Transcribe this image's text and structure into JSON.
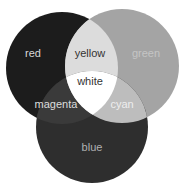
{
  "diagram": {
    "type": "venn",
    "title": "",
    "circles": [
      {
        "id": "red",
        "label": "red",
        "cx": 62,
        "cy": 68,
        "r": 56,
        "fill": "#1c1c1c",
        "text_color": "#d8d8d8"
      },
      {
        "id": "green",
        "label": "green",
        "cx": 122,
        "cy": 66,
        "r": 57,
        "fill": "#a4a4a4",
        "text_color": "#c4c4c4"
      },
      {
        "id": "blue",
        "label": "blue",
        "cx": 92,
        "cy": 127,
        "r": 56,
        "fill": "#2e2e2e",
        "text_color": "#b0b0b0"
      }
    ],
    "overlaps": [
      {
        "id": "yellow",
        "label": "yellow",
        "sets": [
          "red",
          "green"
        ],
        "fill": "#dcdcdc",
        "text_color": "#333333"
      },
      {
        "id": "magenta",
        "label": "magenta",
        "sets": [
          "red",
          "blue"
        ],
        "fill": "#3a3a3a",
        "text_color": "#dddddd"
      },
      {
        "id": "cyan",
        "label": "cyan",
        "sets": [
          "green",
          "blue"
        ],
        "fill": "#bdbdbd",
        "text_color": "#eeeeee"
      },
      {
        "id": "white",
        "label": "white",
        "sets": [
          "red",
          "green",
          "blue"
        ],
        "fill": "#ffffff",
        "text_color": "#333333"
      }
    ]
  }
}
